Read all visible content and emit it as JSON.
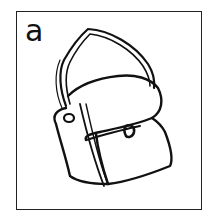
{
  "card": {
    "letter": "a",
    "picture": "bag-illustration",
    "colors": {
      "ink": "#111111",
      "background": "#ffffff",
      "border": "#222222"
    }
  }
}
